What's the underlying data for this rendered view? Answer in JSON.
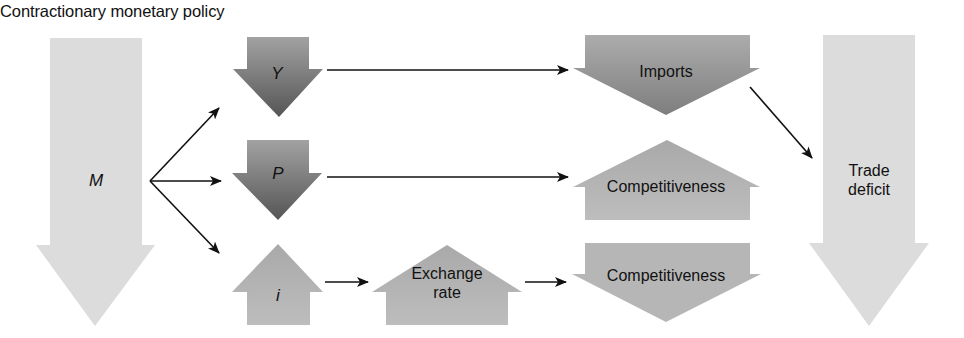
{
  "title": "Contractionary monetary policy",
  "colors": {
    "light_arrow": "#dcdcdc",
    "dark_arrow_top": "#a2a2a2",
    "dark_arrow_bottom": "#555555",
    "medium_arrow": "#b4b4b4",
    "imports_top": "#acacac",
    "imports_bottom": "#7e7e7e",
    "connector": "#111111"
  },
  "nodes": {
    "m": {
      "label": "M",
      "direction": "down"
    },
    "y": {
      "label": "Y",
      "direction": "down"
    },
    "p": {
      "label": "P",
      "direction": "down"
    },
    "i": {
      "label": "i",
      "direction": "up"
    },
    "exchange_rate": {
      "label_line1": "Exchange",
      "label_line2": "rate",
      "direction": "up"
    },
    "imports": {
      "label": "Imports",
      "direction": "down"
    },
    "competitiveness_1": {
      "label": "Competitiveness",
      "direction": "up"
    },
    "competitiveness_2": {
      "label": "Competitiveness",
      "direction": "down"
    },
    "trade_deficit": {
      "label_line1": "Trade",
      "label_line2": "deficit",
      "direction": "down"
    }
  },
  "edges": [
    {
      "from": "M",
      "to": "Y"
    },
    {
      "from": "M",
      "to": "P"
    },
    {
      "from": "M",
      "to": "i"
    },
    {
      "from": "Y",
      "to": "Imports"
    },
    {
      "from": "P",
      "to": "Competitiveness (up)"
    },
    {
      "from": "i",
      "to": "Exchange rate"
    },
    {
      "from": "Exchange rate",
      "to": "Competitiveness (down)"
    },
    {
      "from": "Imports",
      "to": "Trade deficit"
    }
  ]
}
